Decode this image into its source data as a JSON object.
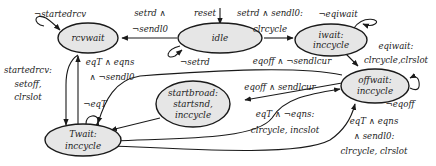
{
  "diagram": {
    "type": "state-machine",
    "colors": {
      "node_fill": "#e6e6e6",
      "stroke": "#1a1a1a",
      "text": "#222222"
    },
    "states": [
      {
        "id": "rcvwait",
        "lines": [
          "rcvwait"
        ]
      },
      {
        "id": "idle",
        "lines": [
          "idle"
        ]
      },
      {
        "id": "iwait",
        "lines": [
          "iwait:",
          "inccycle"
        ]
      },
      {
        "id": "offwait",
        "lines": [
          "offwait:",
          "inccycle"
        ]
      },
      {
        "id": "startbroad",
        "lines": [
          "startbroad:",
          "startsnd,",
          "inccycle"
        ]
      },
      {
        "id": "Twait",
        "lines": [
          "Twait:",
          "inccycle"
        ]
      }
    ],
    "transitions": [
      {
        "from": "start",
        "to": "idle",
        "lines": [
          "reset"
        ]
      },
      {
        "from": "rcvwait",
        "to": "rcvwait",
        "lines": [
          "¬startedrcv"
        ]
      },
      {
        "from": "idle",
        "to": "rcvwait",
        "lines": [
          "setrd ∧",
          "¬sendl0"
        ]
      },
      {
        "from": "idle",
        "to": "idle",
        "lines": [
          "¬setrd"
        ]
      },
      {
        "from": "idle",
        "to": "iwait",
        "lines": [
          "setrd ∧ sendl0:",
          "clrcycle"
        ]
      },
      {
        "from": "iwait",
        "to": "iwait",
        "lines": [
          "¬eqiwait"
        ]
      },
      {
        "from": "iwait",
        "to": "offwait",
        "lines": [
          "eqiwait:",
          "clrcycle,clrslot"
        ]
      },
      {
        "from": "offwait",
        "to": "Twait",
        "lines": [
          "eqoff ∧ ¬sendlcur"
        ]
      },
      {
        "from": "offwait",
        "to": "startbroad",
        "lines": [
          "eqoff ∧ sendlcur"
        ]
      },
      {
        "from": "offwait",
        "to": "offwait",
        "lines": [
          "¬eqoff"
        ]
      },
      {
        "from": "Twait",
        "to": "offwait",
        "lines": [
          "eqT ∧ ¬eqns:",
          "clrcycle, incslot"
        ]
      },
      {
        "from": "Twait",
        "to": "offwait",
        "lines": [
          "eqT ∧ eqns",
          "∧ sendl0:",
          "clrcycle, clrslot"
        ]
      },
      {
        "from": "rcvwait",
        "to": "Twait",
        "lines": [
          "startedrcv:",
          "setoff,",
          "clrslot"
        ]
      },
      {
        "from": "Twait",
        "to": "rcvwait",
        "lines": [
          "eqT ∧ eqns",
          "∧ ¬sendl0"
        ]
      },
      {
        "from": "Twait",
        "to": "Twait",
        "lines": [
          "¬eqT"
        ]
      },
      {
        "from": "startbroad",
        "to": "Twait",
        "lines": []
      }
    ]
  }
}
